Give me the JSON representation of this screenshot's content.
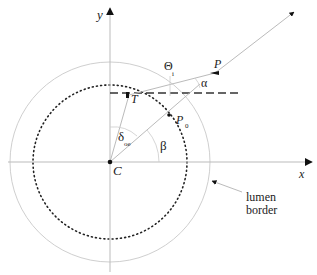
{
  "diagram": {
    "axes": {
      "x_label": "x",
      "y_label": "y"
    },
    "points": {
      "center": "C",
      "tangent": "T",
      "p": "P",
      "p0": "P",
      "p0_sub": "0"
    },
    "angles": {
      "theta": "Θ",
      "theta_sub": "i",
      "alpha": "α",
      "beta": "β",
      "delta": "δ",
      "delta_sub": "oe"
    },
    "annotation": {
      "line1": "lumen",
      "line2": "border"
    },
    "colors": {
      "axis": "#bbbbbb",
      "circle": "#cccccc",
      "ink": "#111111"
    }
  }
}
